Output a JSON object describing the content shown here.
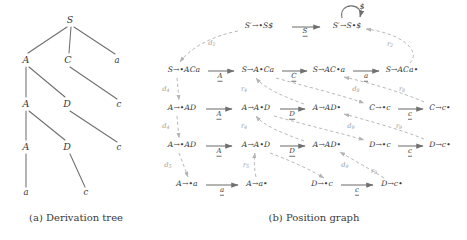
{
  "figure": {
    "panels": [
      {
        "id": "a",
        "caption": "(a) Derivation tree"
      },
      {
        "id": "b",
        "caption": "(b) Position graph"
      }
    ]
  },
  "colors": {
    "ink": "#3a3a3a",
    "solid_edge": "#6f6f6f",
    "dashed_edge": "#b4b4b4",
    "dashed_label": "#9a9a9a"
  },
  "derivation_tree": {
    "caption": "(a) Derivation tree",
    "nodes": [
      {
        "id": "S0",
        "label": "S",
        "kind": "nonterminal",
        "x": 70,
        "y": 20
      },
      {
        "id": "A1",
        "label": "A",
        "kind": "nonterminal",
        "x": 26,
        "y": 60
      },
      {
        "id": "C1",
        "label": "C",
        "kind": "nonterminal",
        "x": 68,
        "y": 60
      },
      {
        "id": "a1",
        "label": "a",
        "kind": "terminal",
        "x": 117,
        "y": 60
      },
      {
        "id": "A2",
        "label": "A",
        "kind": "nonterminal",
        "x": 26,
        "y": 104
      },
      {
        "id": "D1",
        "label": "D",
        "kind": "nonterminal",
        "x": 67,
        "y": 104
      },
      {
        "id": "c1",
        "label": "c",
        "kind": "terminal",
        "x": 119,
        "y": 104
      },
      {
        "id": "A3",
        "label": "A",
        "kind": "nonterminal",
        "x": 26,
        "y": 147
      },
      {
        "id": "D2",
        "label": "D",
        "kind": "nonterminal",
        "x": 67,
        "y": 147
      },
      {
        "id": "c2",
        "label": "c",
        "kind": "terminal",
        "x": 119,
        "y": 147
      },
      {
        "id": "a2",
        "label": "a",
        "kind": "terminal",
        "x": 26,
        "y": 192
      },
      {
        "id": "c3",
        "label": "c",
        "kind": "terminal",
        "x": 86,
        "y": 192
      }
    ],
    "edges": [
      {
        "from": "S0",
        "to": "A1"
      },
      {
        "from": "S0",
        "to": "C1"
      },
      {
        "from": "S0",
        "to": "a1"
      },
      {
        "from": "A1",
        "to": "A2"
      },
      {
        "from": "A1",
        "to": "D1"
      },
      {
        "from": "C1",
        "to": "c1"
      },
      {
        "from": "A2",
        "to": "A3"
      },
      {
        "from": "A2",
        "to": "D2"
      },
      {
        "from": "D1",
        "to": "c2"
      },
      {
        "from": "A3",
        "to": "a2"
      },
      {
        "from": "D2",
        "to": "c3"
      }
    ]
  },
  "position_graph": {
    "caption": "(b) Position graph",
    "items": [
      {
        "id": "n1",
        "text": "S′→•S$",
        "x": 107,
        "y": 26
      },
      {
        "id": "n2",
        "text": "S′→S•$",
        "x": 195,
        "y": 26
      },
      {
        "id": "n3",
        "text": "S→•ACa",
        "x": 32,
        "y": 70
      },
      {
        "id": "n4",
        "text": "S→A•Ca",
        "x": 106,
        "y": 70
      },
      {
        "id": "n5",
        "text": "S→AC•a",
        "x": 177,
        "y": 70
      },
      {
        "id": "n6",
        "text": "S→ACa•",
        "x": 250,
        "y": 70
      },
      {
        "id": "n7",
        "text": "A→•AD",
        "x": 30,
        "y": 108
      },
      {
        "id": "n8",
        "text": "A→A•D",
        "x": 104,
        "y": 108
      },
      {
        "id": "n9",
        "text": "A→AD•",
        "x": 175,
        "y": 108
      },
      {
        "id": "n10",
        "text": "C→•c",
        "x": 228,
        "y": 108
      },
      {
        "id": "n11",
        "text": "C→c•",
        "x": 288,
        "y": 108
      },
      {
        "id": "n12",
        "text": "A→•AD",
        "x": 30,
        "y": 145
      },
      {
        "id": "n13",
        "text": "A→A•D",
        "x": 104,
        "y": 145
      },
      {
        "id": "n14",
        "text": "A→AD•",
        "x": 175,
        "y": 145
      },
      {
        "id": "n15",
        "text": "D→•c",
        "x": 228,
        "y": 145
      },
      {
        "id": "n16",
        "text": "D→c•",
        "x": 288,
        "y": 145
      },
      {
        "id": "n17",
        "text": "A→•a",
        "x": 35,
        "y": 184
      },
      {
        "id": "n18",
        "text": "A→a•",
        "x": 105,
        "y": 184
      },
      {
        "id": "n19",
        "text": "D→•c",
        "x": 170,
        "y": 184
      },
      {
        "id": "n20",
        "text": "D→c•",
        "x": 240,
        "y": 184
      }
    ],
    "shift_edges": [
      {
        "from": "n1",
        "to": "n2",
        "label": "S",
        "lx": 153,
        "ly": 32
      },
      {
        "from": "n2",
        "to": "n2",
        "label": "$",
        "lx": 208,
        "ly": 7,
        "self_loop": true
      },
      {
        "from": "n3",
        "to": "n4",
        "label": "A",
        "lx": 68,
        "ly": 76
      },
      {
        "from": "n4",
        "to": "n5",
        "label": "C",
        "lx": 142,
        "ly": 76
      },
      {
        "from": "n5",
        "to": "n6",
        "label": "a",
        "lx": 214,
        "ly": 76
      },
      {
        "from": "n7",
        "to": "n8",
        "label": "A",
        "lx": 67,
        "ly": 114
      },
      {
        "from": "n8",
        "to": "n9",
        "label": "D",
        "lx": 140,
        "ly": 114
      },
      {
        "from": "n10",
        "to": "n11",
        "label": "c",
        "lx": 258,
        "ly": 114
      },
      {
        "from": "n12",
        "to": "n13",
        "label": "A",
        "lx": 67,
        "ly": 151
      },
      {
        "from": "n13",
        "to": "n14",
        "label": "D",
        "lx": 140,
        "ly": 151
      },
      {
        "from": "n15",
        "to": "n16",
        "label": "c",
        "lx": 258,
        "ly": 151
      },
      {
        "from": "n17",
        "to": "n18",
        "label": "a",
        "lx": 70,
        "ly": 190
      },
      {
        "from": "n19",
        "to": "n20",
        "label": "c",
        "lx": 205,
        "ly": 190
      }
    ],
    "derivation_edges": [
      {
        "id": "d2",
        "label": "d",
        "sub": "2",
        "lx": 60,
        "ly": 44
      },
      {
        "id": "d4",
        "label": "d",
        "sub": "4",
        "lx": 14,
        "ly": 90
      },
      {
        "id": "d4b",
        "label": "d",
        "sub": "4",
        "lx": 14,
        "ly": 127
      },
      {
        "id": "d5",
        "label": "d",
        "sub": "5",
        "lx": 16,
        "ly": 166
      },
      {
        "id": "d8",
        "label": "d",
        "sub": "8",
        "lx": 204,
        "ly": 90
      },
      {
        "id": "d9",
        "label": "d",
        "sub": "9",
        "lx": 199,
        "ly": 127
      },
      {
        "id": "d9b",
        "label": "d",
        "sub": "9",
        "lx": 193,
        "ly": 166
      }
    ],
    "reduction_edges": [
      {
        "id": "r2",
        "label": "r",
        "sub": "2",
        "lx": 238,
        "ly": 45
      },
      {
        "id": "r4",
        "label": "r",
        "sub": "4",
        "lx": 92,
        "ly": 90
      },
      {
        "id": "r8",
        "label": "r",
        "sub": "8",
        "lx": 250,
        "ly": 127
      },
      {
        "id": "r4b",
        "label": "r",
        "sub": "4",
        "lx": 92,
        "ly": 127
      },
      {
        "id": "r9",
        "label": "r",
        "sub": "9",
        "lx": 247,
        "ly": 166
      },
      {
        "id": "r5",
        "label": "r",
        "sub": "5",
        "lx": 94,
        "ly": 166
      },
      {
        "id": "r9b",
        "label": "r",
        "sub": "9",
        "lx": 222,
        "ly": 172
      }
    ]
  }
}
